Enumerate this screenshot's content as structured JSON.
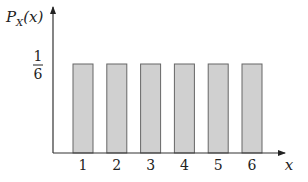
{
  "chart_data": {
    "type": "bar",
    "title": "",
    "xlabel": "x",
    "ylabel": "P_X(x)",
    "ylabel_main": "P",
    "ylabel_sub": "X",
    "ylabel_arg": "(x)",
    "categories": [
      "1",
      "2",
      "3",
      "4",
      "5",
      "6"
    ],
    "values": [
      0.1667,
      0.1667,
      0.1667,
      0.1667,
      0.1667,
      0.1667
    ],
    "y_tick": {
      "numerator": "1",
      "denominator": "6",
      "value": 0.1667
    },
    "ylim": [
      0,
      0.25
    ],
    "grid": false,
    "legend": null,
    "colors": {
      "bar_fill": "#d0d0d0",
      "bar_stroke": "#666666",
      "axis": "#333333"
    }
  }
}
